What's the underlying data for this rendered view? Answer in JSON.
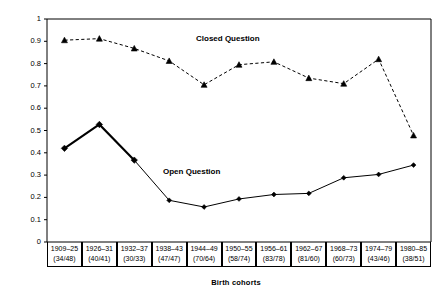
{
  "chart_data": {
    "type": "line",
    "title": "",
    "xlabel": "Birth cohorts",
    "ylabel": "Predicted probabilities",
    "ylim": [
      0,
      1
    ],
    "yticks": [
      "0",
      "0.1",
      "0.2",
      "0.3",
      "0.4",
      "0.5",
      "0.6",
      "0.7",
      "0.8",
      "0.9",
      "1"
    ],
    "grid": false,
    "legend": "inline-annotations",
    "categories": [
      "1909–25",
      "1926–31",
      "1932–37",
      "1938–43",
      "1944–49",
      "1950–55",
      "1956–61",
      "1962–67",
      "1968–73",
      "1974–79",
      "1980–85"
    ],
    "category_counts": [
      "(34/48)",
      "(40/41)",
      "(30/33)",
      "(47/47)",
      "(70/64)",
      "(58/74)",
      "(83/78)",
      "(81/60)",
      "(60/73)",
      "(43/46)",
      "(38/51)"
    ],
    "series": [
      {
        "name": "Closed Question",
        "marker": "triangle",
        "linestyle": "dashed",
        "color": "#000000",
        "values": [
          0.905,
          0.912,
          0.868,
          0.812,
          0.705,
          0.795,
          0.808,
          0.735,
          0.71,
          0.82,
          0.478
        ]
      },
      {
        "name": "Open Question",
        "marker": "diamond",
        "linestyle": "solid",
        "color": "#000000",
        "values": [
          0.42,
          0.527,
          0.367,
          0.187,
          0.157,
          0.193,
          0.213,
          0.218,
          0.288,
          0.303,
          0.345
        ]
      }
    ]
  },
  "annotations": {
    "closed_label": "Closed Question",
    "open_label": "Open Question"
  }
}
